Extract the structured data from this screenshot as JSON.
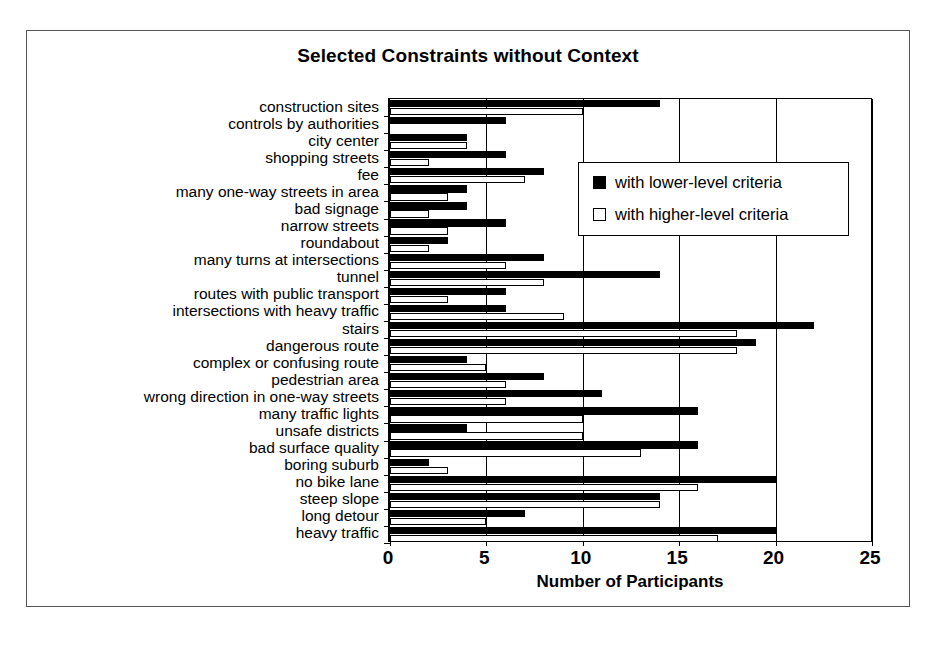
{
  "figure": {
    "title": "Selected Constraints without Context"
  },
  "chart_data": {
    "type": "bar",
    "orientation": "horizontal",
    "title": "Selected Constraints without Context",
    "xlabel": "Number of Participants",
    "ylabel": "",
    "xlim": [
      0,
      25
    ],
    "xticks": [
      0,
      5,
      10,
      15,
      20,
      25
    ],
    "grid": true,
    "legend_position": "upper-right-inside",
    "categories": [
      "construction sites",
      "controls by authorities",
      "city center",
      "shopping streets",
      "fee",
      "many one-way streets in area",
      "bad signage",
      "narrow streets",
      "roundabout",
      "many turns at intersections",
      "tunnel",
      "routes with public transport",
      "intersections with heavy traffic",
      "stairs",
      "dangerous route",
      "complex or confusing route",
      "pedestrian area",
      "wrong direction in one-way streets",
      "many traffic lights",
      "unsafe districts",
      "bad surface quality",
      "boring suburb",
      "no bike lane",
      "steep slope",
      "long detour",
      "heavy traffic"
    ],
    "series": [
      {
        "name": "with lower-level criteria",
        "color": "#000000",
        "values": [
          14,
          6,
          4,
          6,
          8,
          4,
          4,
          6,
          3,
          8,
          14,
          6,
          6,
          22,
          19,
          4,
          8,
          11,
          16,
          4,
          16,
          2,
          20,
          14,
          7,
          20
        ]
      },
      {
        "name": "with higher-level criteria",
        "color": "#ffffff",
        "values": [
          10,
          0,
          4,
          2,
          7,
          3,
          2,
          3,
          2,
          6,
          8,
          3,
          9,
          18,
          18,
          5,
          6,
          6,
          10,
          10,
          13,
          3,
          16,
          14,
          5,
          17
        ]
      }
    ]
  },
  "legend": {
    "items": [
      {
        "label": "with lower-level criteria",
        "swatch": "filled-black-square"
      },
      {
        "label": "with higher-level criteria",
        "swatch": "open-white-square"
      }
    ]
  },
  "axis": {
    "x_title": "Number of Participants",
    "x_tick_labels": [
      "0",
      "5",
      "10",
      "15",
      "20",
      "25"
    ]
  }
}
